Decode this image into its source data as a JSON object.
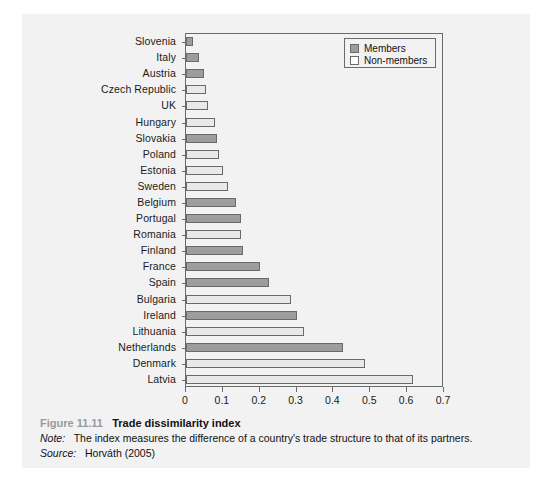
{
  "figure": {
    "number": "Figure 11.11",
    "title": "Trade dissimilarity index",
    "note_label": "Note:",
    "note_text": "The index measures the difference of a country's trade structure to that of its partners.",
    "source_label": "Source:",
    "source_text": "Horváth (2005)"
  },
  "legend": {
    "position": "top-right",
    "items": [
      {
        "label": "Members",
        "color": "#9d9d9d"
      },
      {
        "label": "Non-members",
        "color": "#ffffff"
      }
    ]
  },
  "colors": {
    "members": "#9d9d9d",
    "nonmembers": "#e9e9e9",
    "bar_border": "#6a6a6a",
    "axis": "#6b6b6b",
    "panel": "#f2f2f2",
    "page": "#ffffff"
  },
  "chart_data": {
    "type": "bar",
    "orientation": "horizontal",
    "title": "Trade dissimilarity index",
    "xlabel": "",
    "ylabel": "",
    "xlim": [
      0,
      0.7
    ],
    "xticks": [
      "0",
      "0.1",
      "0.2",
      "0.3",
      "0.4",
      "0.5",
      "0.6",
      "0.7"
    ],
    "xtick_values": [
      0,
      0.1,
      0.2,
      0.3,
      0.4,
      0.5,
      0.6,
      0.7
    ],
    "grid": false,
    "legend_entries": [
      "Members",
      "Non-members"
    ],
    "categories": [
      "Slovenia",
      "Italy",
      "Austria",
      "Czech Republic",
      "UK",
      "Hungary",
      "Slovakia",
      "Poland",
      "Estonia",
      "Sweden",
      "Belgium",
      "Portugal",
      "Romania",
      "Finland",
      "France",
      "Spain",
      "Bulgaria",
      "Ireland",
      "Lithuania",
      "Netherlands",
      "Denmark",
      "Latvia"
    ],
    "values": [
      0.02,
      0.035,
      0.05,
      0.055,
      0.06,
      0.08,
      0.085,
      0.09,
      0.1,
      0.115,
      0.135,
      0.15,
      0.15,
      0.155,
      0.2,
      0.225,
      0.285,
      0.3,
      0.32,
      0.425,
      0.485,
      0.615
    ],
    "groups": [
      "Members",
      "Members",
      "Members",
      "Non-members",
      "Non-members",
      "Non-members",
      "Members",
      "Non-members",
      "Non-members",
      "Non-members",
      "Members",
      "Members",
      "Non-members",
      "Members",
      "Members",
      "Members",
      "Non-members",
      "Members",
      "Non-members",
      "Members",
      "Non-members",
      "Non-members"
    ]
  }
}
